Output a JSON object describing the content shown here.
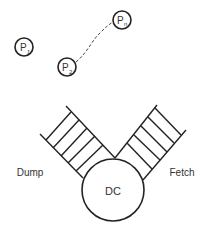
{
  "diagram": {
    "processes": [
      {
        "id": "p1",
        "label": "P",
        "sub": "1",
        "cx": 24,
        "cy": 47
      },
      {
        "id": "p2",
        "label": "P",
        "sub": "2",
        "cx": 67,
        "cy": 67
      },
      {
        "id": "pn",
        "label": "P",
        "sub": "n",
        "cx": 122,
        "cy": 20
      }
    ],
    "connector": {
      "from": "p2",
      "to": "pn",
      "style": "dashed"
    },
    "center": {
      "label": "DC"
    },
    "stacks": [
      {
        "id": "dump",
        "label": "Dump",
        "rungs": 5
      },
      {
        "id": "fetch",
        "label": "Fetch",
        "rungs": 5
      }
    ],
    "colors": {
      "stroke": "#222222",
      "text": "#333333",
      "background": "#ffffff"
    }
  }
}
